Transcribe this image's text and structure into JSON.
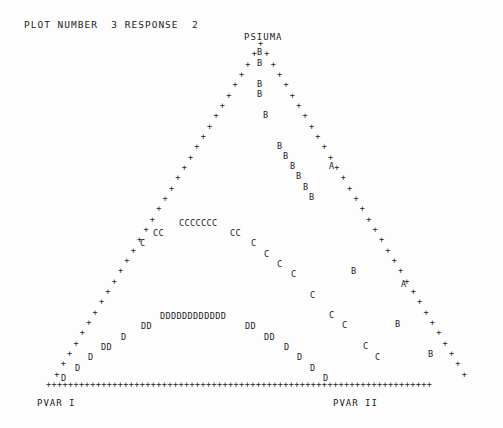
{
  "header": {
    "title": "PLOT NUMBER  3 RESPONSE  2"
  },
  "labels": {
    "top": "PSIUMA",
    "left": "PVAR I",
    "right": "PVAR II"
  },
  "chart_data": {
    "type": "scatter",
    "title": "PLOT NUMBER  3 RESPONSE  2",
    "subtype": "ternary contour (line-printer)",
    "vertices": [
      "PSIUMA",
      "PVAR I",
      "PVAR II"
    ],
    "border_char": "+",
    "contour_levels": [
      "A",
      "B",
      "C",
      "D"
    ],
    "points": [
      {
        "c": "B",
        "x": 260,
        "y": 52
      },
      {
        "c": "B",
        "x": 260,
        "y": 63
      },
      {
        "c": "B",
        "x": 260,
        "y": 84
      },
      {
        "c": "B",
        "x": 260,
        "y": 94
      },
      {
        "c": "B",
        "x": 266,
        "y": 115
      },
      {
        "c": "B",
        "x": 280,
        "y": 146
      },
      {
        "c": "B",
        "x": 286,
        "y": 156
      },
      {
        "c": "B",
        "x": 293,
        "y": 166
      },
      {
        "c": "B",
        "x": 299,
        "y": 176
      },
      {
        "c": "B",
        "x": 306,
        "y": 187
      },
      {
        "c": "B",
        "x": 312,
        "y": 197
      },
      {
        "c": "A",
        "x": 332,
        "y": 166
      },
      {
        "c": "A",
        "x": 404,
        "y": 284
      },
      {
        "c": "B",
        "x": 354,
        "y": 271
      },
      {
        "c": "B",
        "x": 398,
        "y": 324
      },
      {
        "c": "B",
        "x": 431,
        "y": 354
      },
      {
        "c": "C",
        "x": 182,
        "y": 223,
        "s": "CCCCCCC"
      },
      {
        "c": "C",
        "x": 156,
        "y": 233,
        "s": "CC"
      },
      {
        "c": "C",
        "x": 233,
        "y": 233,
        "s": "CC"
      },
      {
        "c": "C",
        "x": 143,
        "y": 243
      },
      {
        "c": "C",
        "x": 254,
        "y": 243
      },
      {
        "c": "C",
        "x": 267,
        "y": 254
      },
      {
        "c": "C",
        "x": 280,
        "y": 264
      },
      {
        "c": "C",
        "x": 294,
        "y": 274
      },
      {
        "c": "C",
        "x": 313,
        "y": 295
      },
      {
        "c": "C",
        "x": 332,
        "y": 315
      },
      {
        "c": "C",
        "x": 345,
        "y": 325
      },
      {
        "c": "C",
        "x": 366,
        "y": 346
      },
      {
        "c": "C",
        "x": 378,
        "y": 357
      },
      {
        "c": "D",
        "x": 163,
        "y": 316,
        "s": "DDDDDDDDDDDD"
      },
      {
        "c": "D",
        "x": 144,
        "y": 326,
        "s": "DD"
      },
      {
        "c": "D",
        "x": 248,
        "y": 326,
        "s": "DD"
      },
      {
        "c": "D",
        "x": 124,
        "y": 337
      },
      {
        "c": "D",
        "x": 267,
        "y": 337,
        "s": "DD"
      },
      {
        "c": "D",
        "x": 104,
        "y": 347,
        "s": "DD"
      },
      {
        "c": "D",
        "x": 287,
        "y": 347
      },
      {
        "c": "D",
        "x": 91,
        "y": 357
      },
      {
        "c": "D",
        "x": 300,
        "y": 357
      },
      {
        "c": "D",
        "x": 78,
        "y": 368
      },
      {
        "c": "D",
        "x": 313,
        "y": 368
      },
      {
        "c": "D",
        "x": 64,
        "y": 378
      },
      {
        "c": "D",
        "x": 326,
        "y": 378
      }
    ]
  }
}
